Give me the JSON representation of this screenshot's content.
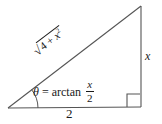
{
  "figure": {
    "stroke_color": "#555555",
    "text_color": "#1a1a1a",
    "background_color": "#ffffff",
    "vertices": {
      "left": [
        8,
        108
      ],
      "bottom_right": [
        141,
        107
      ],
      "top_right": [
        141,
        6
      ]
    },
    "labels": {
      "base": "2",
      "height": "x",
      "hypotenuse_sign": "√",
      "hypotenuse_radicand_a": "4 + ",
      "hypotenuse_radicand_x": "x",
      "hypotenuse_radicand_exp": "2",
      "hypotenuse_full": "√(4 + x²)",
      "theta_symbol": "θ",
      "equals": "=",
      "function_name": "arctan",
      "fraction_numerator": "x",
      "fraction_denominator": "2",
      "theta_equation_full": "θ = arctan x/2"
    },
    "markers": {
      "right_angle": "right-angle-square",
      "angle_arc": "theta-angle-arc"
    }
  }
}
